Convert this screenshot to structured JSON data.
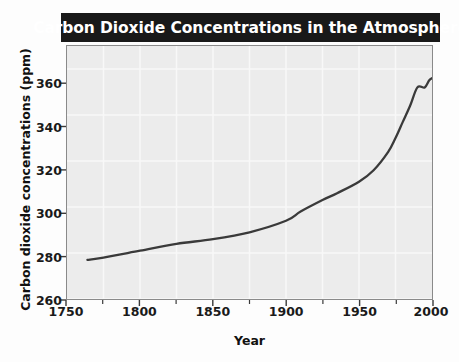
{
  "figure": {
    "title": "Carbon Dioxide Concentrations in the Atmosphere",
    "title_bar_color": "#191919",
    "title_text_color": "#ffffff",
    "plot_background_color": "#ececec",
    "gridline_color": "#f8f8f8",
    "frame_color": "#8a8a8a",
    "line_color": "#3a3a3a"
  },
  "axes": {
    "x_title": "Year",
    "y_title": "Carbon dioxide concentrations (ppm)",
    "x_ticks": [
      "1750",
      "1800",
      "1850",
      "1900",
      "1950",
      "2000"
    ],
    "y_ticks": [
      "360",
      "340",
      "320",
      "300",
      "280",
      "260"
    ]
  },
  "chart_data": {
    "type": "line",
    "title": "Carbon Dioxide Concentrations in the Atmosphere",
    "xlabel": "Year",
    "ylabel": "Carbon dioxide concentrations (ppm)",
    "xlim": [
      1750,
      2000
    ],
    "ylim": [
      260,
      370
    ],
    "xticks": [
      1750,
      1800,
      1850,
      1900,
      1950,
      2000
    ],
    "yticks": [
      260,
      280,
      300,
      320,
      340,
      360
    ],
    "x_minor_tick_interval": 25,
    "grid": true,
    "legend": null,
    "series": [
      {
        "name": "Atmospheric CO2 concentration",
        "x": [
          1764,
          1775,
          1800,
          1825,
          1850,
          1875,
          1900,
          1910,
          1925,
          1935,
          1950,
          1960,
          1970,
          1975,
          1980,
          1985,
          1990,
          1995,
          1998,
          2000
        ],
        "values": [
          277,
          278,
          281,
          284,
          286,
          289,
          294,
          298,
          303,
          306,
          311,
          316,
          324,
          330,
          337,
          344,
          352,
          352,
          355,
          356
        ]
      }
    ]
  }
}
